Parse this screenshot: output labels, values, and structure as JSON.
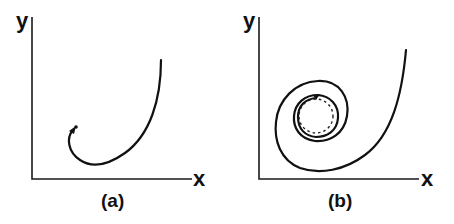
{
  "panels": [
    {
      "id": "a",
      "caption": "(a)",
      "x_label": "x",
      "y_label": "y",
      "description": "Trajectory curving down from upper right and ending with arrow at a point"
    },
    {
      "id": "b",
      "caption": "(b)",
      "x_label": "x",
      "y_label": "y",
      "description": "Trajectory spiraling inward toward a dashed limit cycle"
    }
  ],
  "colors": {
    "line": "#111111",
    "background": "#ffffff"
  }
}
